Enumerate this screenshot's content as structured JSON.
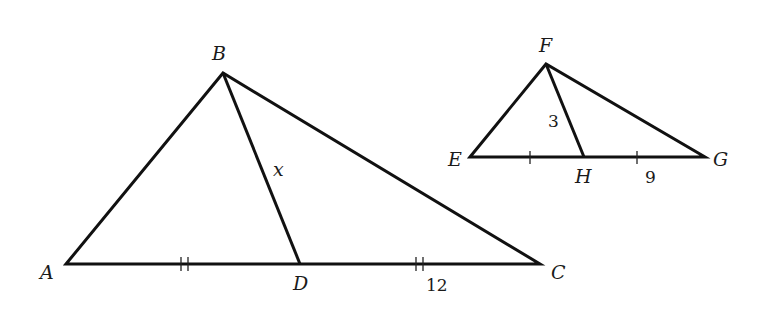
{
  "figure": {
    "left_triangle": {
      "name": "triangle-ABC",
      "vertices": {
        "A": {
          "label": "A",
          "x": 66,
          "y": 264
        },
        "B": {
          "label": "B",
          "x": 223,
          "y": 73
        },
        "C": {
          "label": "C",
          "x": 540,
          "y": 264
        },
        "D": {
          "label": "D",
          "x": 300,
          "y": 264
        }
      },
      "segment_labels": {
        "BD": "x",
        "DC": "12"
      },
      "tick_marks": {
        "AD": 2,
        "DC": 2
      }
    },
    "right_triangle": {
      "name": "triangle-EFG",
      "vertices": {
        "E": {
          "label": "E",
          "x": 470,
          "y": 157
        },
        "F": {
          "label": "F",
          "x": 546,
          "y": 64
        },
        "G": {
          "label": "G",
          "x": 705,
          "y": 157
        },
        "H": {
          "label": "H",
          "x": 584,
          "y": 157
        }
      },
      "segment_labels": {
        "FH": "3",
        "HG": "9"
      },
      "tick_marks": {
        "EH": 1,
        "HG": 1
      }
    },
    "colors": {
      "stroke": "#111111",
      "background": "#ffffff"
    }
  }
}
